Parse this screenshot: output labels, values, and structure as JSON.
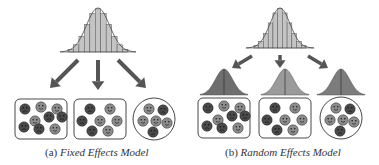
{
  "panels": [
    {
      "id": "a",
      "prefix": "(a)",
      "title": "Fixed Effects Model",
      "has_group_distributions": false,
      "groups": [
        {
          "shape": "rounded-rect",
          "faces": [
            "sad",
            "neutral",
            "neutral",
            "sad",
            "neutral",
            "sad",
            "sad",
            "neutral",
            "sad"
          ]
        },
        {
          "shape": "rounded-rect",
          "faces": [
            "sad",
            "neutral",
            "neutral",
            "sad",
            "neutral",
            "sad",
            "neutral"
          ]
        },
        {
          "shape": "circle",
          "faces": [
            "neutral",
            "sad",
            "neutral",
            "neutral",
            "neutral",
            "sad"
          ]
        }
      ]
    },
    {
      "id": "b",
      "prefix": "(b)",
      "title": "Random Effects Model",
      "has_group_distributions": true,
      "groups": [
        {
          "shape": "rounded-rect",
          "faces": [
            "sad",
            "neutral",
            "neutral",
            "sad",
            "neutral",
            "sad",
            "sad",
            "neutral",
            "sad"
          ]
        },
        {
          "shape": "rounded-rect",
          "faces": [
            "sad",
            "neutral",
            "neutral",
            "sad",
            "neutral",
            "sad",
            "neutral"
          ]
        },
        {
          "shape": "circle",
          "faces": [
            "neutral",
            "sad",
            "neutral",
            "neutral",
            "neutral",
            "sad"
          ]
        }
      ]
    }
  ],
  "colors": {
    "histogram_fill": "#c4c4c4",
    "histogram_stroke": "#555555",
    "arrow": "#555555",
    "face_dark": "#4a4a4a",
    "face_light": "#8c8c8c",
    "group_dist": [
      "#6e6e6e",
      "#9a9a9a",
      "#7c7c7c"
    ]
  }
}
